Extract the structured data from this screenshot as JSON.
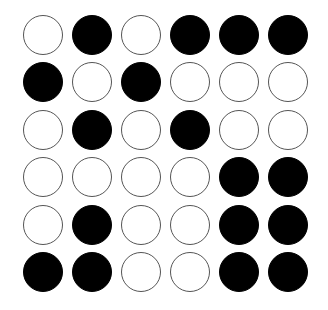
{
  "board": {
    "rows": 6,
    "cols": 6,
    "colors": {
      "black": "#000000",
      "white": "#ffffff",
      "outline": "#555555"
    },
    "grid": [
      [
        "white",
        "black",
        "white",
        "black",
        "black",
        "black"
      ],
      [
        "black",
        "white",
        "black",
        "white",
        "white",
        "white"
      ],
      [
        "white",
        "black",
        "white",
        "black",
        "white",
        "white"
      ],
      [
        "white",
        "white",
        "white",
        "white",
        "black",
        "black"
      ],
      [
        "white",
        "black",
        "white",
        "white",
        "black",
        "black"
      ],
      [
        "black",
        "black",
        "white",
        "white",
        "black",
        "black"
      ]
    ]
  }
}
